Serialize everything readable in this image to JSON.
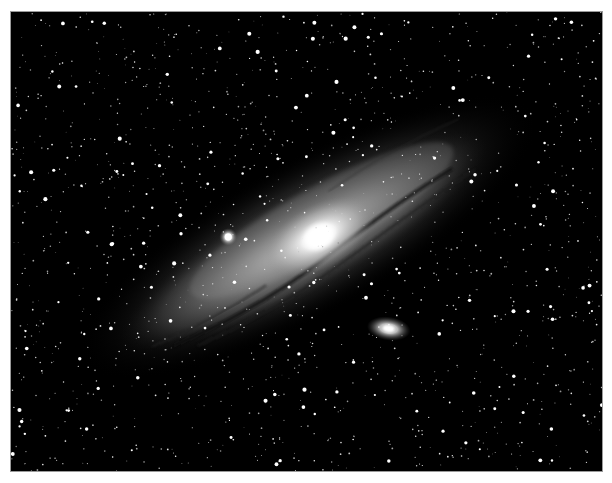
{
  "image": {
    "subject": "Andromeda Galaxy",
    "description": "Black-and-white astrophotograph of a large spiral galaxy seen nearly edge-on, tilted diagonally from lower-left to upper-right, with a bright central core, dark dust lanes, two satellite galaxies, and a dense field of foreground stars.",
    "features": {
      "core": "bright galactic nucleus",
      "satellite_1": "compact bright satellite galaxy left of the core",
      "satellite_2": "small elliptical satellite galaxy below-right of the core",
      "dust_lanes": "dark dust lanes along the lower edge of the disk",
      "starfield": "dense foreground star field"
    },
    "colors": {
      "sky": "#000000",
      "stars": "#ffffff",
      "galaxy_glow": "#bdbdbd",
      "border": "#9a9a9a",
      "page": "#ffffff"
    }
  }
}
